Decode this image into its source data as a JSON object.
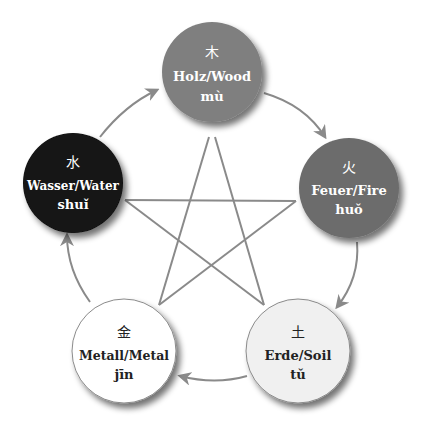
{
  "diagram": {
    "colors": {
      "line": "#8a8a8a",
      "shadow": "#000000"
    },
    "nodes": [
      {
        "id": "wood",
        "hanzi": "木",
        "label": "Holz/Wood",
        "pinyin": "mù",
        "fill": "#7f7f7f",
        "text_color": "#ffffff",
        "cx": 212,
        "cy": 72,
        "r": 50
      },
      {
        "id": "fire",
        "hanzi": "火",
        "label": "Feuer/Fire",
        "pinyin": "huǒ",
        "fill": "#6c6c6c",
        "text_color": "#ffffff",
        "cx": 349,
        "cy": 188,
        "r": 50
      },
      {
        "id": "soil",
        "hanzi": "土",
        "label": "Erde/Soil",
        "pinyin": "tǔ",
        "fill": "#f0f0f0",
        "text_color": "#222222",
        "cx": 298,
        "cy": 351,
        "r": 52
      },
      {
        "id": "metal",
        "hanzi": "金",
        "label": "Metall/Metal",
        "pinyin": "jīn",
        "fill": "#ffffff",
        "text_color": "#222222",
        "cx": 124,
        "cy": 351,
        "r": 52
      },
      {
        "id": "water",
        "hanzi": "水",
        "label": "Wasser/Water",
        "pinyin": "shuǐ",
        "fill": "#121212",
        "text_color": "#ffffff",
        "cx": 73,
        "cy": 183,
        "r": 50
      }
    ],
    "generating_cycle": [
      {
        "from": "wood",
        "to": "fire"
      },
      {
        "from": "fire",
        "to": "soil"
      },
      {
        "from": "soil",
        "to": "metal"
      },
      {
        "from": "metal",
        "to": "water"
      },
      {
        "from": "water",
        "to": "wood"
      }
    ],
    "controlling_cycle": [
      {
        "from": "wood",
        "to": "soil"
      },
      {
        "from": "soil",
        "to": "water"
      },
      {
        "from": "water",
        "to": "fire"
      },
      {
        "from": "fire",
        "to": "metal"
      },
      {
        "from": "metal",
        "to": "wood"
      }
    ]
  }
}
